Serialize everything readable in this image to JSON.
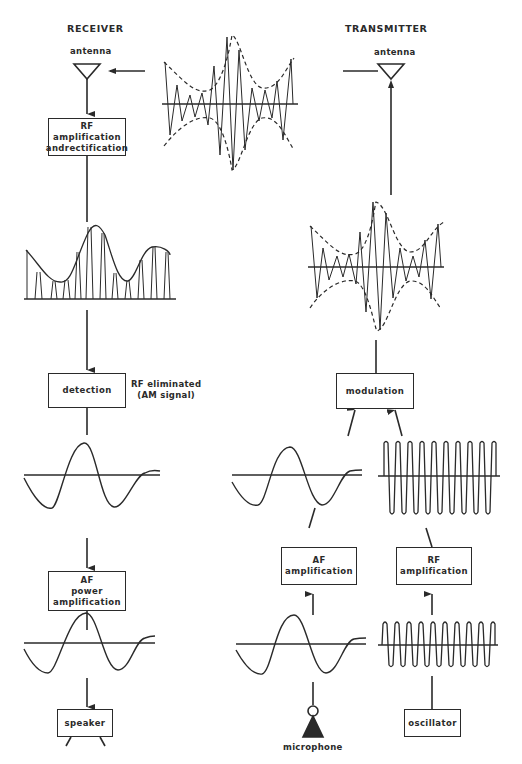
{
  "headings": {
    "receiver": "RECEIVER",
    "transmitter": "TRANSMITTER"
  },
  "receiver": {
    "antenna_label": "antenna",
    "rf_box": {
      "line1": "RF",
      "line2": "amplification",
      "line3": "andrectification"
    },
    "detection_box": {
      "line1": "detection"
    },
    "detection_note": {
      "line1": "RF eliminated",
      "line2": "(AM signal)"
    },
    "af_box": {
      "line1": "AF",
      "line2": "power",
      "line3": "amplification"
    },
    "speaker_box": {
      "line1": "speaker"
    }
  },
  "transmitter": {
    "antenna_label": "antenna",
    "modulation_box": {
      "line1": "modulation"
    },
    "af_box": {
      "line1": "AF",
      "line2": "amplification"
    },
    "rf_box": {
      "line1": "RF",
      "line2": "amplification"
    },
    "oscillator_box": {
      "line1": "oscillator"
    },
    "microphone_label": "microphone"
  },
  "colors": {
    "ink": "#2a2a2a",
    "background": "#ffffff"
  }
}
